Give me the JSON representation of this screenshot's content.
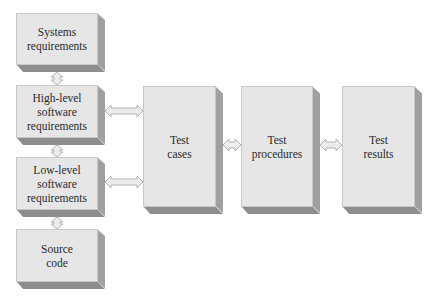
{
  "diagram": {
    "type": "flow",
    "nodes": [
      {
        "id": "systems_requirements",
        "label": "Systems\nrequirements"
      },
      {
        "id": "high_level_requirements",
        "label": "High-level\nsoftware\nrequirements"
      },
      {
        "id": "low_level_requirements",
        "label": "Low-level\nsoftware\nrequirements"
      },
      {
        "id": "source_code",
        "label": "Source\ncode"
      },
      {
        "id": "test_cases",
        "label": "Test\ncases"
      },
      {
        "id": "test_procedures",
        "label": "Test\nprocedures"
      },
      {
        "id": "test_results",
        "label": "Test\nresults"
      }
    ],
    "edges": [
      {
        "from": "systems_requirements",
        "to": "high_level_requirements",
        "style": "double-arrow"
      },
      {
        "from": "high_level_requirements",
        "to": "low_level_requirements",
        "style": "double-arrow"
      },
      {
        "from": "low_level_requirements",
        "to": "source_code",
        "style": "double-arrow"
      },
      {
        "from": "high_level_requirements",
        "to": "test_cases",
        "style": "double-arrow"
      },
      {
        "from": "low_level_requirements",
        "to": "test_cases",
        "style": "double-arrow"
      },
      {
        "from": "test_cases",
        "to": "test_procedures",
        "style": "double-arrow"
      },
      {
        "from": "test_procedures",
        "to": "test_results",
        "style": "double-arrow"
      }
    ]
  },
  "colors": {
    "box_face": "#e6e6e6",
    "box_side": "#a0a0a0",
    "box_bottom": "#8e8e8e",
    "arrow_fill": "#ececec",
    "arrow_stroke": "#b4b4b4",
    "text": "#2a2a2a"
  }
}
